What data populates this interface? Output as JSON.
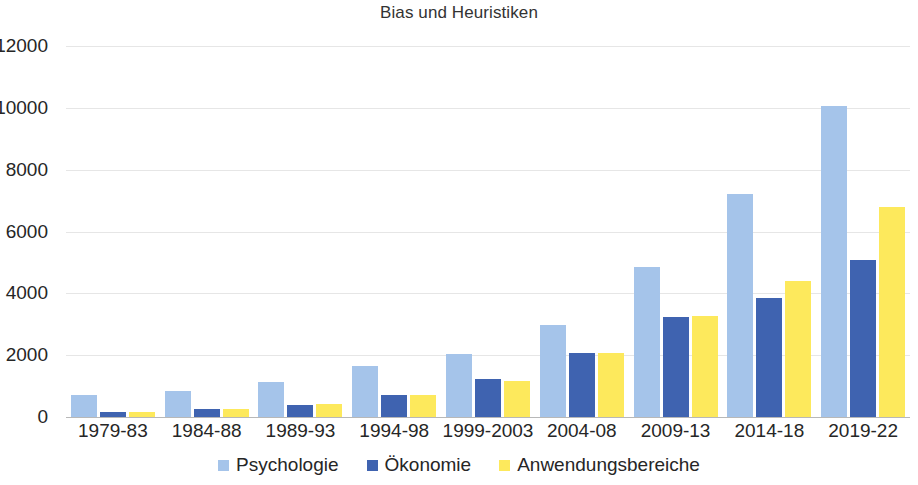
{
  "chart_data": {
    "type": "bar",
    "title": "Bias und Heuristiken",
    "xlabel": "",
    "ylabel": "",
    "ylim": [
      0,
      12000
    ],
    "yticks": [
      "0",
      "2000",
      "4000",
      "6000",
      "8000",
      "10000",
      "12000"
    ],
    "ytick_values": [
      0,
      2000,
      4000,
      6000,
      8000,
      10000,
      12000
    ],
    "grid": true,
    "legend_position": "bottom",
    "categories": [
      "1979-83",
      "1984-88",
      "1989-93",
      "1994-98",
      "1999-2003",
      "2004-08",
      "2009-13",
      "2014-18",
      "2019-22"
    ],
    "series": [
      {
        "name": "Psychologie",
        "color": "#a5c4ea",
        "values": [
          700,
          850,
          1120,
          1650,
          2050,
          2980,
          4850,
          7200,
          10050
        ]
      },
      {
        "name": "Ökonomie",
        "color": "#3f63b0",
        "values": [
          160,
          250,
          400,
          720,
          1220,
          2080,
          3220,
          3850,
          5080
        ]
      },
      {
        "name": "Anwendungsbereiche",
        "color": "#fde95c",
        "values": [
          160,
          250,
          410,
          710,
          1180,
          2080,
          3280,
          4400,
          6800
        ]
      }
    ]
  }
}
